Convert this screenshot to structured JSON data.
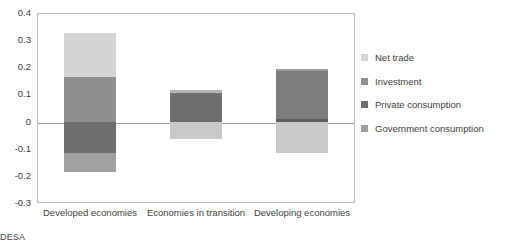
{
  "chart_data": {
    "type": "bar",
    "subtype": "stacked-diverging",
    "title": "",
    "xlabel": "",
    "ylabel": "",
    "ylim": [
      -0.3,
      0.4
    ],
    "ytick_step": 0.1,
    "yticks": [
      "0.4",
      "0.3",
      "0.2",
      "0.1",
      "0",
      "-0.1",
      "-0.2",
      "-0.3"
    ],
    "grid": false,
    "zero_line": true,
    "legend_position": "right",
    "categories": [
      "Developed economies",
      "Economies in transition",
      "Developing economies"
    ],
    "series": [
      {
        "name": "Net trade",
        "color": "#d4d4d4",
        "values": [
          0.16,
          0.01,
          0.01
        ]
      },
      {
        "name": "Investment",
        "color": "#8f8f8f",
        "values": [
          0.165,
          0.105,
          0.175
        ]
      },
      {
        "name": "Private consumption",
        "color": "#6e6e6e",
        "values": [
          -0.115,
          -0.065,
          0.01
        ]
      },
      {
        "name": "Government consumption",
        "color": "#a0a0a0",
        "values": [
          -0.07,
          0.0,
          -0.115
        ]
      }
    ],
    "bars": [
      {
        "category": "Developed economies",
        "segments": [
          {
            "series": "Net trade",
            "from": 0.165,
            "to": 0.325,
            "color": "#d4d4d4"
          },
          {
            "series": "Investment",
            "from": 0.0,
            "to": 0.165,
            "color": "#8f8f8f"
          },
          {
            "series": "Private consumption",
            "from": -0.115,
            "to": 0.0,
            "color": "#6e6e6e"
          },
          {
            "series": "Government consumption",
            "from": -0.185,
            "to": -0.115,
            "color": "#a0a0a0"
          }
        ],
        "total_positive": 0.325,
        "total_negative": -0.185
      },
      {
        "category": "Economies in transition",
        "segments": [
          {
            "series": "Net trade",
            "from": 0.105,
            "to": 0.115,
            "color": "#b5b5b5"
          },
          {
            "series": "Investment",
            "from": 0.0,
            "to": 0.105,
            "color": "#6e6e6e"
          },
          {
            "series": "Private consumption",
            "from": -0.065,
            "to": 0.0,
            "color": "#c9c9c9"
          }
        ],
        "total_positive": 0.115,
        "total_negative": -0.065
      },
      {
        "category": "Developing economies",
        "segments": [
          {
            "series": "Net trade",
            "from": 0.185,
            "to": 0.195,
            "color": "#9a9a9a"
          },
          {
            "series": "Investment",
            "from": 0.01,
            "to": 0.185,
            "color": "#7d7d7d"
          },
          {
            "series": "Private consumption",
            "from": 0.0,
            "to": 0.01,
            "color": "#5e5e5e"
          },
          {
            "series": "Government consumption",
            "from": -0.115,
            "to": 0.0,
            "color": "#c9c9c9"
          }
        ],
        "total_positive": 0.195,
        "total_negative": -0.115
      }
    ]
  },
  "legend": {
    "items": [
      {
        "label": "Net trade",
        "color": "#d4d4d4"
      },
      {
        "label": "Investment",
        "color": "#8f8f8f"
      },
      {
        "label": "Private consumption",
        "color": "#6e6e6e"
      },
      {
        "label": "Government consumption",
        "color": "#a0a0a0"
      }
    ]
  },
  "source_note": "DESA",
  "colors": {
    "axis": "#b9b9b9",
    "zero_line": "#9a9a9a",
    "text": "#3f3f3f",
    "background": "#ffffff"
  }
}
